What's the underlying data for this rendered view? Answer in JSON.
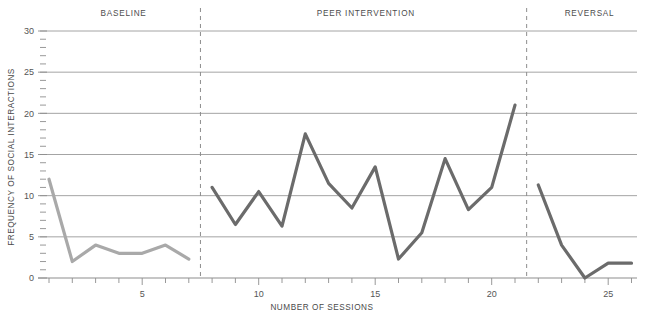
{
  "chart_data": {
    "type": "line",
    "title": "",
    "xlabel": "NUMBER OF SESSIONS",
    "ylabel": "FREQUENCY OF SOCIAL INTERACTIONS",
    "xlim": [
      0,
      27
    ],
    "ylim": [
      0,
      30
    ],
    "grid": true,
    "legend": "none",
    "x_tick_labels": [
      "5",
      "10",
      "15",
      "20",
      "25"
    ],
    "x_tick_values": [
      5,
      10,
      15,
      20,
      25
    ],
    "x_minor_ticks": [
      1,
      2,
      3,
      4,
      5,
      6,
      7,
      8,
      9,
      10,
      11,
      12,
      13,
      14,
      15,
      16,
      17,
      18,
      19,
      20,
      21,
      22,
      23,
      24,
      25,
      26
    ],
    "y_tick_labels": [
      "0",
      "5",
      "10",
      "15",
      "20",
      "25",
      "30"
    ],
    "y_tick_values": [
      0,
      5,
      10,
      15,
      20,
      25,
      30
    ],
    "y_minor_step": 1,
    "phase_dividers": [
      7.5,
      21.5
    ],
    "series": [
      {
        "name": "BASELINE",
        "color": "#a9a9a9",
        "x": [
          1,
          2,
          3,
          4,
          5,
          6,
          7
        ],
        "values": [
          12,
          2,
          4,
          3,
          3,
          4,
          2.3
        ]
      },
      {
        "name": "PEER INTERVENTION",
        "color": "#6b6b6b",
        "x": [
          8,
          9,
          10,
          11,
          12,
          13,
          14,
          15,
          16,
          17,
          18,
          19,
          20,
          21
        ],
        "values": [
          11,
          6.5,
          10.5,
          6.3,
          17.5,
          11.5,
          8.5,
          13.5,
          2.3,
          5.5,
          14.5,
          8.3,
          11,
          21
        ]
      },
      {
        "name": "REVERSAL",
        "color": "#6b6b6b",
        "x": [
          22,
          23,
          24,
          25,
          26
        ],
        "values": [
          11.3,
          4,
          0,
          1.8,
          1.8
        ]
      }
    ],
    "phase_labels": [
      {
        "text": "BASELINE",
        "center_x": 4.2
      },
      {
        "text": "PEER INTERVENTION",
        "center_x": 14.6
      },
      {
        "text": "REVERSAL",
        "center_x": 24.2
      }
    ],
    "colors": {
      "background": "#ffffff",
      "gridline": "#9a9a9a",
      "axis": "#8d8d8d",
      "divider": "#8d8d8d",
      "text": "#555555",
      "baseline_line": "#a9a9a9",
      "intervention_line": "#6b6b6b"
    }
  }
}
